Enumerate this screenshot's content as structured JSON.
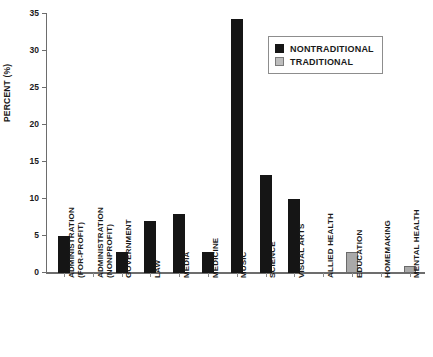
{
  "chart_data": {
    "type": "bar",
    "title": "",
    "xlabel": "",
    "ylabel": "PERCENT (%)",
    "ylim": [
      0,
      35
    ],
    "ytick_step": 5,
    "yticks": [
      "0",
      "5",
      "10",
      "15",
      "20",
      "25",
      "30",
      "35"
    ],
    "grid": false,
    "legend_position": "top-right",
    "categories": [
      "ADMINISTRATION (FOR-PROFIT)",
      "ADMINISTRATION (NONPROFIT)",
      "GOVERNMENT",
      "LAW",
      "MEDIA",
      "MEDICINE",
      "MUSIC",
      "SCIENCE",
      "VISUAL ARTS",
      "ALLIED HEALTH",
      "EDUCATION",
      "HOMEMAKING",
      "MENTAL HEALTH"
    ],
    "category_lines": [
      [
        "ADMINISTRATION",
        "(FOR-PROFIT)"
      ],
      [
        "ADMINISTRATION",
        "(NONPROFIT)"
      ],
      [
        "GOVERNMENT",
        ""
      ],
      [
        "LAW",
        ""
      ],
      [
        "MEDIA",
        ""
      ],
      [
        "MEDICINE",
        ""
      ],
      [
        "MUSIC",
        ""
      ],
      [
        "SCIENCE",
        ""
      ],
      [
        "VISUAL ARTS",
        ""
      ],
      [
        "ALLIED HEALTH",
        ""
      ],
      [
        "EDUCATION",
        ""
      ],
      [
        "HOMEMAKING",
        ""
      ],
      [
        "MENTAL HEALTH",
        ""
      ]
    ],
    "series": [
      {
        "name": "NONTRADITIONAL",
        "color": "#151515",
        "values": [
          5.0,
          0,
          2.8,
          7.0,
          8.0,
          2.8,
          34.3,
          13.2,
          10.0,
          0,
          0,
          0,
          0
        ]
      },
      {
        "name": "TRADITIONAL",
        "color": "#a9a9a9",
        "values": [
          0,
          0,
          0,
          0,
          0,
          0,
          0,
          0,
          0,
          0,
          2.8,
          0,
          1.0
        ]
      }
    ]
  },
  "legend": {
    "items": [
      {
        "label": "NONTRADITIONAL",
        "swatch": "nontraditional"
      },
      {
        "label": "TRADITIONAL",
        "swatch": "traditional"
      }
    ]
  }
}
